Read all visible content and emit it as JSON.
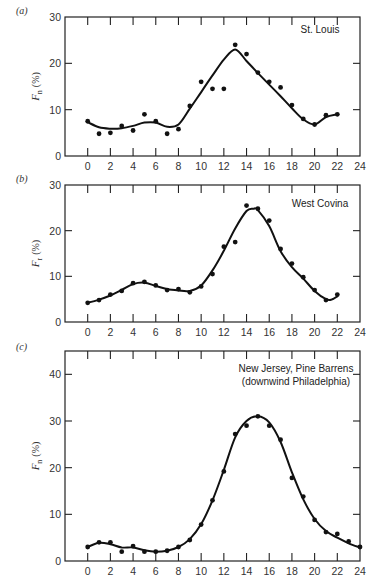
{
  "chart_data": [
    {
      "type": "scatter",
      "panel": "(a)",
      "title": "St. Louis",
      "xlabel": "",
      "ylabel": "F_n (%)",
      "ylabel_symbol": "F",
      "ylabel_sub": "n",
      "ylabel_unit": "(%)",
      "xlim": [
        -2,
        24
      ],
      "ylim": [
        0,
        30
      ],
      "xticks": [
        0,
        2,
        4,
        6,
        8,
        10,
        12,
        14,
        16,
        18,
        20,
        22,
        24
      ],
      "yticks": [
        0,
        10,
        20,
        30
      ],
      "grid": false,
      "points": {
        "x": [
          0,
          1,
          2,
          3,
          4,
          5,
          6,
          7,
          8,
          9,
          10,
          11,
          12,
          13,
          14,
          15,
          16,
          17,
          18,
          19,
          20,
          21,
          22
        ],
        "y": [
          7.5,
          4.8,
          5.0,
          6.5,
          5.5,
          9.0,
          7.5,
          4.8,
          5.8,
          10.8,
          16.0,
          14.5,
          14.5,
          24.0,
          22.0,
          18.0,
          16.0,
          14.8,
          11.0,
          8.0,
          6.8,
          8.8,
          9.0
        ]
      },
      "curve": {
        "x": [
          0,
          1,
          2,
          3,
          4,
          5,
          6,
          7,
          8,
          9,
          10,
          11,
          12,
          13,
          14,
          15,
          16,
          17,
          18,
          19,
          20,
          21,
          22
        ],
        "y": [
          7.3,
          6.2,
          5.9,
          6.0,
          6.5,
          7.2,
          7.2,
          6.3,
          6.8,
          10.2,
          13.8,
          17.4,
          20.8,
          23.0,
          20.5,
          17.9,
          15.4,
          12.9,
          10.3,
          7.9,
          6.8,
          8.4,
          9.0
        ]
      }
    },
    {
      "type": "scatter",
      "panel": "(b)",
      "title": "West Covina",
      "xlabel": "",
      "ylabel": "F_r (%)",
      "ylabel_symbol": "F",
      "ylabel_sub": "r",
      "ylabel_unit": "(%)",
      "xlim": [
        -2,
        24
      ],
      "ylim": [
        0,
        30
      ],
      "xticks": [
        0,
        2,
        4,
        6,
        8,
        10,
        12,
        14,
        16,
        18,
        20,
        22,
        24
      ],
      "yticks": [
        0,
        10,
        20,
        30
      ],
      "grid": false,
      "points": {
        "x": [
          0,
          1,
          2,
          3,
          4,
          5,
          6,
          7,
          8,
          9,
          10,
          11,
          12,
          13,
          14,
          15,
          16,
          17,
          18,
          19,
          20,
          21,
          22
        ],
        "y": [
          4.2,
          4.8,
          6.0,
          6.8,
          8.5,
          8.8,
          8.0,
          7.0,
          7.2,
          6.5,
          7.8,
          10.5,
          16.5,
          17.5,
          25.5,
          24.8,
          22.2,
          16.0,
          12.8,
          9.8,
          7.0,
          4.8,
          6.0
        ]
      },
      "curve": {
        "x": [
          0,
          1,
          2,
          3,
          4,
          5,
          6,
          7,
          8,
          9,
          10,
          11,
          12,
          13,
          14,
          14.6,
          15,
          16,
          17,
          18,
          19,
          20,
          21,
          21.5,
          22
        ],
        "y": [
          4.2,
          4.9,
          5.8,
          7.0,
          8.3,
          8.6,
          7.9,
          7.2,
          6.9,
          6.8,
          8.0,
          11.3,
          15.6,
          20.5,
          24.3,
          24.8,
          24.5,
          21.0,
          15.5,
          12.0,
          9.5,
          6.8,
          5.0,
          4.9,
          5.6
        ]
      }
    },
    {
      "type": "scatter",
      "panel": "(c)",
      "title": "New Jersey, Pine Barrens",
      "subtitle": "(downwind Philadelphia)",
      "xlabel": "",
      "ylabel": "F_n (%)",
      "ylabel_symbol": "F",
      "ylabel_sub": "n",
      "ylabel_unit": "(%)",
      "xlim": [
        -2,
        24
      ],
      "ylim": [
        0,
        45
      ],
      "xticks": [
        0,
        2,
        4,
        6,
        8,
        10,
        12,
        14,
        16,
        18,
        20,
        22,
        24
      ],
      "yticks": [
        0,
        10,
        20,
        30,
        40
      ],
      "grid": false,
      "points": {
        "x": [
          0,
          1,
          2,
          3,
          4,
          5,
          6,
          7,
          8,
          9,
          10,
          11,
          12,
          13,
          14,
          15,
          16,
          17,
          18,
          19,
          20,
          21,
          22,
          23,
          24
        ],
        "y": [
          3.0,
          4.0,
          4.0,
          2.0,
          3.2,
          2.0,
          2.0,
          2.2,
          3.0,
          4.5,
          7.8,
          13.0,
          19.2,
          27.2,
          29.0,
          31.0,
          29.0,
          26.0,
          17.8,
          13.8,
          8.8,
          6.2,
          5.8,
          4.2,
          3.0
        ]
      },
      "curve": {
        "x": [
          0,
          1,
          2,
          3,
          4,
          5,
          6,
          7,
          8,
          9,
          10,
          11,
          12,
          13,
          14,
          15,
          16,
          17,
          18,
          19,
          20,
          21,
          22,
          23,
          24
        ],
        "y": [
          3.0,
          3.9,
          3.6,
          2.9,
          2.9,
          2.3,
          2.0,
          2.2,
          3.0,
          4.7,
          7.9,
          13.0,
          19.5,
          26.5,
          30.0,
          31.0,
          29.7,
          25.5,
          19.0,
          13.2,
          9.0,
          6.4,
          5.0,
          3.8,
          2.9
        ]
      }
    }
  ],
  "panels": [
    {
      "label": "(a)",
      "annotation": [
        "St. Louis"
      ]
    },
    {
      "label": "(b)",
      "annotation": [
        "West Covina"
      ]
    },
    {
      "label": "(c)",
      "annotation": [
        "New Jersey, Pine Barrens",
        "(downwind Philadelphia)"
      ]
    }
  ]
}
